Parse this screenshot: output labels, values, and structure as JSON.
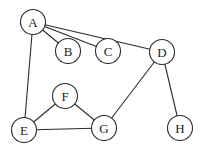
{
  "diagram": {
    "type": "undirected-graph",
    "node_radius": 12.5,
    "colors": {
      "stroke": "#2a2a2a",
      "fill": "#ffffff",
      "text": "#222222",
      "background": "#ffffff"
    },
    "nodes": [
      {
        "id": "A",
        "label": "A",
        "x": 33,
        "y": 22
      },
      {
        "id": "B",
        "label": "B",
        "x": 68,
        "y": 51
      },
      {
        "id": "C",
        "label": "C",
        "x": 108,
        "y": 51
      },
      {
        "id": "D",
        "label": "D",
        "x": 162,
        "y": 52
      },
      {
        "id": "E",
        "label": "E",
        "x": 24,
        "y": 130
      },
      {
        "id": "F",
        "label": "F",
        "x": 65,
        "y": 96
      },
      {
        "id": "G",
        "label": "G",
        "x": 104,
        "y": 128
      },
      {
        "id": "H",
        "label": "H",
        "x": 180,
        "y": 128
      }
    ],
    "edges": [
      {
        "from": "A",
        "to": "B"
      },
      {
        "from": "A",
        "to": "C"
      },
      {
        "from": "A",
        "to": "D"
      },
      {
        "from": "A",
        "to": "E"
      },
      {
        "from": "E",
        "to": "F"
      },
      {
        "from": "E",
        "to": "G"
      },
      {
        "from": "F",
        "to": "G"
      },
      {
        "from": "G",
        "to": "D"
      },
      {
        "from": "D",
        "to": "H"
      }
    ]
  }
}
